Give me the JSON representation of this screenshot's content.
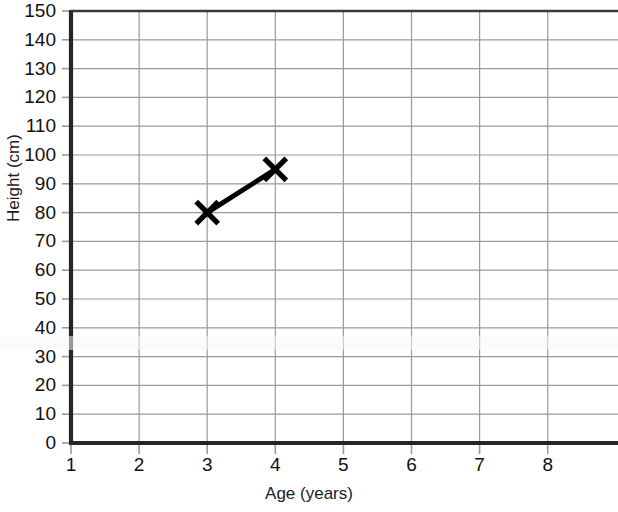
{
  "chart_data": {
    "type": "line",
    "title": "",
    "xlabel": "Age (years)",
    "ylabel": "Height (cm)",
    "xlim": [
      1,
      8.8
    ],
    "ylim": [
      0,
      150
    ],
    "x_ticks": [
      1,
      2,
      3,
      4,
      5,
      6,
      7,
      8
    ],
    "y_ticks": [
      0,
      10,
      20,
      30,
      40,
      50,
      60,
      70,
      80,
      90,
      100,
      110,
      120,
      130,
      140,
      150
    ],
    "grid": true,
    "legend": "none",
    "marker": "x-cross",
    "series": [
      {
        "name": "Height vs Age",
        "color": "#000000",
        "x": [
          3,
          4
        ],
        "y": [
          80,
          95
        ]
      }
    ],
    "points": [
      {
        "x": 3,
        "y": 80
      },
      {
        "x": 4,
        "y": 95
      }
    ]
  },
  "axes": {
    "x_tick_labels": [
      "1",
      "2",
      "3",
      "4",
      "5",
      "6",
      "7",
      "8"
    ],
    "y_tick_labels": [
      "150",
      "140",
      "130",
      "120",
      "110",
      "100",
      "90",
      "80",
      "70",
      "60",
      "50",
      "40",
      "30",
      "20",
      "10",
      "0"
    ],
    "x_title": "Age (years)",
    "y_title": "Height (cm)"
  },
  "colors": {
    "axis": "#262626",
    "grid": "#9a9a9a",
    "data": "#000000",
    "background": "#ffffff",
    "text": "#111111"
  }
}
